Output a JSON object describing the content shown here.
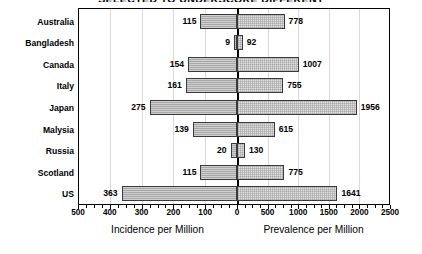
{
  "chart_data": {
    "type": "bar",
    "orientation": "horizontal",
    "subtype": "bidirectional-dual-scale",
    "title": "SELECTED TO UNDERSCORE DIFFERENT",
    "categories": [
      "Australia",
      "Bangladesh",
      "Canada",
      "Italy",
      "Japan",
      "Malysia",
      "Russia",
      "Scotland",
      "US"
    ],
    "series": [
      {
        "name": "Incidence per Million",
        "side": "left",
        "values": [
          115,
          9,
          154,
          161,
          275,
          139,
          20,
          115,
          363
        ],
        "axis_range": [
          0,
          500
        ],
        "axis_ticks": [
          500,
          400,
          300,
          200,
          100,
          0
        ],
        "fill": "#a8a8a8"
      },
      {
        "name": "Prevalence per Million",
        "side": "right",
        "values": [
          778,
          92,
          1007,
          755,
          1956,
          615,
          130,
          775,
          1641
        ],
        "axis_range": [
          0,
          2500
        ],
        "axis_ticks": [
          0,
          500,
          1000,
          1500,
          2000,
          2500
        ],
        "fill": "#e2e2e2"
      }
    ],
    "xlabel_left": "Incidence  per  Million",
    "xlabel_right": "Prevalence  per  Million",
    "ylabel": "",
    "grid": true,
    "legend": "none"
  },
  "axis": {
    "left_ticks": [
      "500",
      "400",
      "300",
      "200",
      "100"
    ],
    "zero_tick": "0",
    "right_ticks": [
      "500",
      "1000",
      "1500",
      "2000",
      "2500"
    ],
    "left_title": "Incidence  per  Million",
    "right_title": "Prevalence  per  Million"
  },
  "rows": [
    {
      "category": "Australia",
      "incidence": "115",
      "prevalence": "778"
    },
    {
      "category": "Bangladesh",
      "incidence": "9",
      "prevalence": "92"
    },
    {
      "category": "Canada",
      "incidence": "154",
      "prevalence": "1007"
    },
    {
      "category": "Italy",
      "incidence": "161",
      "prevalence": "755"
    },
    {
      "category": "Japan",
      "incidence": "275",
      "prevalence": "1956"
    },
    {
      "category": "Malysia",
      "incidence": "139",
      "prevalence": "615"
    },
    {
      "category": "Russia",
      "incidence": "20",
      "prevalence": "130"
    },
    {
      "category": "Scotland",
      "incidence": "115",
      "prevalence": "775"
    },
    {
      "category": "US",
      "incidence": "363",
      "prevalence": "1641"
    }
  ],
  "header": {
    "title": "SELECTED TO UNDERSCORE DIFFERENT"
  }
}
